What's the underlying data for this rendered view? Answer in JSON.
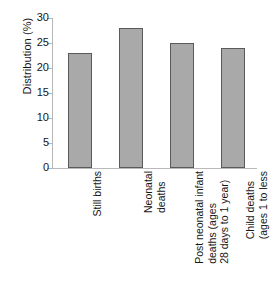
{
  "chart_data": {
    "type": "bar",
    "title": "",
    "subtitle": "",
    "xlabel": "",
    "ylabel": "Distribution (%)",
    "ylim": [
      0,
      30
    ],
    "yticks": [
      0,
      5,
      10,
      15,
      20,
      25,
      30
    ],
    "ytick_labels": [
      "0",
      "5",
      "10",
      "15",
      "20",
      "25",
      "30"
    ],
    "grid": false,
    "legend": null,
    "categories": [
      "Still births",
      "Neonatal deaths",
      "Post neonatal infant deaths (ages 28 days to 1 year)",
      "Child deaths (ages 1 to less than 5 years)"
    ],
    "category_label_lines": [
      [
        "Still births"
      ],
      [
        "Neonatal",
        "deaths"
      ],
      [
        "Post neonatal infant",
        "deaths (ages",
        "28 days to 1 year)"
      ],
      [
        "Child deaths",
        "(ages 1 to less",
        "than 5 years)"
      ]
    ],
    "values": [
      23,
      28,
      25,
      24
    ],
    "bar_color": "#a9a9a9",
    "bar_border_color": "#5a5a5a",
    "axis_color": "#b6b6b6",
    "text_color": "#161616"
  }
}
